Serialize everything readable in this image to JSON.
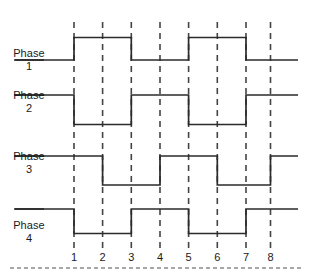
{
  "figure": {
    "background_color": "#ffffff",
    "trace_color": "#2b2b2b",
    "guide_color": "#444444",
    "text_color": "#1a1a1a"
  },
  "axis": {
    "tick_labels": [
      "1",
      "2",
      "3",
      "4",
      "5",
      "6",
      "7",
      "8"
    ],
    "tick_x": [
      74,
      102.6,
      131.3,
      160,
      188.6,
      217.3,
      246,
      270.5
    ],
    "guide_top": 22,
    "guide_bottom": 250,
    "trace_left": 14,
    "trace_right": 298
  },
  "separator": {
    "name": "footer-dashed-rule",
    "x1": 10,
    "x2": 302,
    "y": 268
  },
  "phases": [
    {
      "name": "phase-1",
      "label_name": "Phase",
      "label_number": "1",
      "label_x": 8,
      "label_y": 47,
      "lead_y": 60,
      "high_y": 37.5,
      "low_y": 60,
      "start_level": "low",
      "transitions": [
        74,
        131.3,
        188.6,
        246
      ],
      "levels": [
        "low",
        "high",
        "low",
        "high",
        "low"
      ]
    },
    {
      "name": "phase-2",
      "label_name": "Phase",
      "label_number": "2",
      "label_x": 8,
      "label_y": 89,
      "lead_y": 95,
      "high_y": 95,
      "low_y": 124.5,
      "start_level": "high",
      "transitions": [
        74,
        131.3,
        188.6,
        246
      ],
      "levels": [
        "high",
        "low",
        "high",
        "low",
        "high"
      ]
    },
    {
      "name": "phase-3",
      "label_name": "Phase",
      "label_number": "3",
      "label_x": 8,
      "label_y": 150,
      "lead_y": 156,
      "high_y": 156,
      "low_y": 185,
      "start_level": "high",
      "transitions": [
        102.6,
        160,
        217.3,
        270.5
      ],
      "levels": [
        "high",
        "low",
        "high",
        "low",
        "high"
      ]
    },
    {
      "name": "phase-4",
      "label_name": "Phase",
      "label_number": "4",
      "label_x": 8,
      "label_y": 219,
      "lead_y": 209,
      "high_y": 209,
      "low_y": 233.5,
      "start_level": "high",
      "transitions": [
        74,
        131.3,
        188.6,
        246
      ],
      "levels": [
        "high",
        "low",
        "high",
        "low",
        "high"
      ]
    }
  ],
  "chart_data": {
    "type": "line",
    "xlabel": "",
    "ylabel": "",
    "x": [
      1,
      2,
      3,
      4,
      5,
      6,
      7,
      8
    ],
    "xlim": [
      0,
      9
    ],
    "grid": "vertical-dashed",
    "legend": "none",
    "series": [
      {
        "name": "Phase 1",
        "waveform": "digital",
        "initial_level": 0,
        "edges": [
          {
            "at": 1,
            "to": 1
          },
          {
            "at": 3,
            "to": 0
          },
          {
            "at": 5,
            "to": 1
          },
          {
            "at": 7,
            "to": 0
          }
        ],
        "values_at_ticks": [
          1,
          1,
          0,
          0,
          1,
          1,
          0,
          0
        ]
      },
      {
        "name": "Phase 2",
        "waveform": "digital",
        "initial_level": 1,
        "edges": [
          {
            "at": 1,
            "to": 0
          },
          {
            "at": 3,
            "to": 1
          },
          {
            "at": 5,
            "to": 0
          },
          {
            "at": 7,
            "to": 1
          }
        ],
        "values_at_ticks": [
          0,
          0,
          1,
          1,
          0,
          0,
          1,
          1
        ]
      },
      {
        "name": "Phase 3",
        "waveform": "digital",
        "initial_level": 1,
        "edges": [
          {
            "at": 2,
            "to": 0
          },
          {
            "at": 4,
            "to": 1
          },
          {
            "at": 6,
            "to": 0
          },
          {
            "at": 8,
            "to": 1
          }
        ],
        "values_at_ticks": [
          1,
          0,
          0,
          1,
          1,
          0,
          0,
          1
        ]
      },
      {
        "name": "Phase 4",
        "waveform": "digital",
        "initial_level": 1,
        "edges": [
          {
            "at": 1,
            "to": 0
          },
          {
            "at": 3,
            "to": 1
          },
          {
            "at": 5,
            "to": 0
          },
          {
            "at": 7,
            "to": 1
          }
        ],
        "values_at_ticks": [
          0,
          0,
          1,
          1,
          0,
          0,
          1,
          1
        ]
      }
    ]
  }
}
